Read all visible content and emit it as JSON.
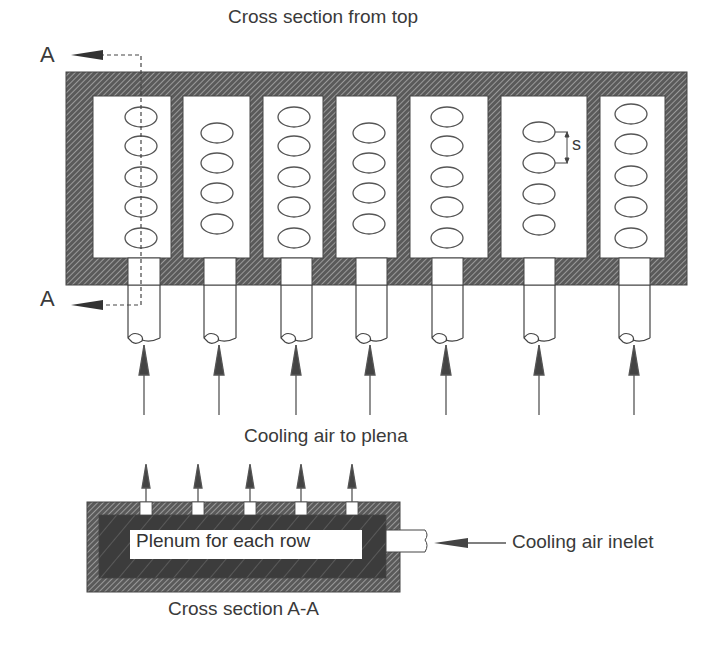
{
  "title": "Cross section from top",
  "section_marker_top": "A",
  "section_marker_bottom": "A",
  "spacing_label": "s",
  "middle_label": "Cooling air to plena",
  "plenum_label": "Plenum for each row",
  "inlet_label": "Cooling air inelet",
  "bottom_caption": "Cross section A-A",
  "colors": {
    "line": "#4a4a4a",
    "hatch_bg": "#5a5a5a",
    "hatch_line": "#d0d0d0",
    "plenum_dark": "#3c3c3c",
    "text": "#3a3a3a"
  },
  "rows": [
    {
      "id": 1,
      "hole_count": 5
    },
    {
      "id": 2,
      "hole_count": 4
    },
    {
      "id": 3,
      "hole_count": 5
    },
    {
      "id": 4,
      "hole_count": 4
    },
    {
      "id": 5,
      "hole_count": 5
    },
    {
      "id": 6,
      "hole_count": 4
    },
    {
      "id": 7,
      "hole_count": 5
    }
  ],
  "plenum_outlets": 5
}
